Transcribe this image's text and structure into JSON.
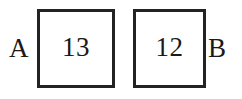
{
  "diagram": {
    "type": "two-box-labeled-diagram",
    "background_color": "#ffffff",
    "border_color": "#232323",
    "text_color": "#1a1a1a",
    "left_label": "A",
    "right_label": "B",
    "boxes": [
      {
        "id": "box-a",
        "value": "13",
        "adjacent_label": "A",
        "label_side": "left"
      },
      {
        "id": "box-b",
        "value": "12",
        "adjacent_label": "B",
        "label_side": "right"
      }
    ]
  }
}
